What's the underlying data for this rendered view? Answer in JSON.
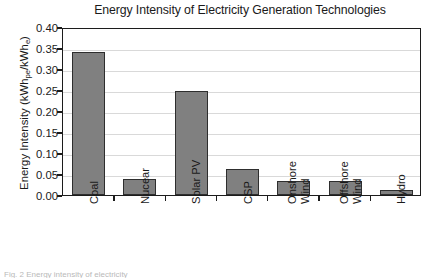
{
  "chart_data": {
    "type": "bar",
    "title": "Energy Intensity of Electricity Generation Technologies",
    "xlabel": "",
    "ylabel": "Energy Intensity (kWhpe/kWhe)",
    "ylabel_parts": {
      "prefix": "Energy Intensity (kWh",
      "sub1": "pe",
      "middle": "/kWh",
      "sub2": "e",
      "suffix": ")"
    },
    "categories": [
      "Coal",
      "Nucear",
      "Solar PV",
      "CSP",
      "Onshore Wind",
      "Offshore Wind",
      "Hydro"
    ],
    "category_lines": [
      [
        "Coal"
      ],
      [
        "Nucear"
      ],
      [
        "Solar PV"
      ],
      [
        "CSP"
      ],
      [
        "Onshore",
        "Wind"
      ],
      [
        "Offshore",
        "Wind"
      ],
      [
        "Hydro"
      ]
    ],
    "values": [
      0.34,
      0.038,
      0.247,
      0.063,
      0.033,
      0.034,
      0.013
    ],
    "ylim": [
      0.0,
      0.4
    ],
    "yticks": [
      0.0,
      0.05,
      0.1,
      0.15,
      0.2,
      0.25,
      0.3,
      0.35,
      0.4
    ],
    "ytick_labels": [
      "0.00",
      "0.05",
      "0.10",
      "0.15",
      "0.20",
      "0.25",
      "0.30",
      "0.35",
      "0.40"
    ],
    "grid": true,
    "grid_axis": "y",
    "legend": null,
    "bar_color": "#808080",
    "bar_edge_color": "#2e2e2e",
    "axis_color": "#1c1c1c",
    "grid_color": "#d9d9d9",
    "background": "#ffffff"
  },
  "caption": {
    "fragment": "Fig. 2  Energy intensity of electricity"
  }
}
